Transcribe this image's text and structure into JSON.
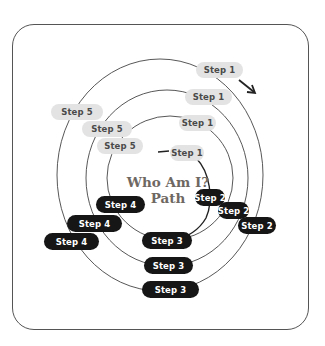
{
  "diagram": {
    "title_line1": "Who Am I?",
    "title_line2": "Path",
    "colors": {
      "light_pill_bg": "#e3e3e3",
      "light_pill_text": "#4a4a4a",
      "dark_pill_bg": "#161616",
      "dark_pill_text": "#ffffff",
      "title": "#6e6762",
      "ring_stroke": "#444444",
      "frame_border": "#555555"
    },
    "rings": [
      {
        "name": "outer",
        "steps": {
          "step1": "Step 1",
          "step2": "Step 2",
          "step3": "Step 3",
          "step4": "Step 4",
          "step5": "Step 5"
        }
      },
      {
        "name": "second",
        "steps": {
          "step1": "Step 1",
          "step2": "Step 2",
          "step3": "Step 3",
          "step4": "Step 4",
          "step5": "Step 5"
        }
      },
      {
        "name": "third",
        "steps": {
          "step1": "Step 1",
          "step2": "Step 2",
          "step3": "Step 3",
          "step4": "Step 4",
          "step5": "Step 5"
        }
      },
      {
        "name": "inner",
        "steps": {
          "step1": "Step 1"
        }
      }
    ],
    "direction_arrow": "clockwise-arrow"
  }
}
